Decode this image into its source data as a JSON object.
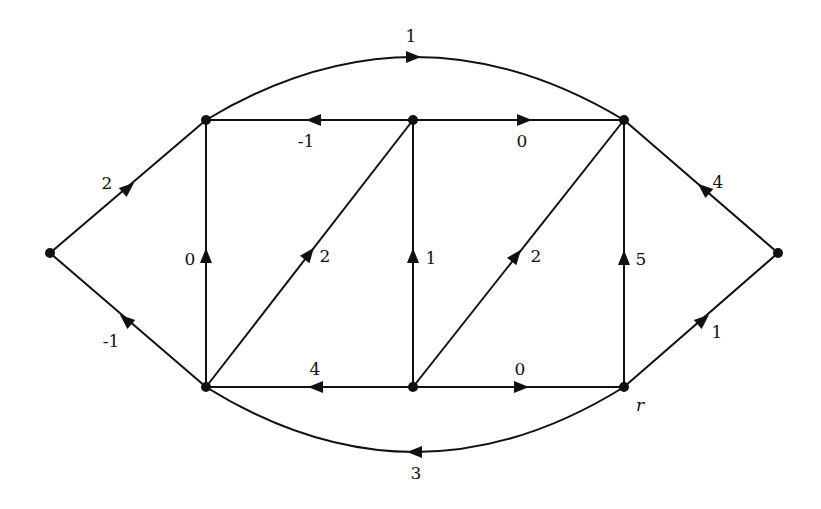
{
  "diagram": {
    "type": "directed-graph",
    "colors": {
      "stroke": "#111111",
      "background": "#ffffff"
    },
    "nodes": [
      {
        "id": "L",
        "x": 50,
        "y": 253,
        "label": ""
      },
      {
        "id": "TL",
        "x": 206,
        "y": 120,
        "label": ""
      },
      {
        "id": "TM",
        "x": 413,
        "y": 120,
        "label": ""
      },
      {
        "id": "TR",
        "x": 624,
        "y": 120,
        "label": ""
      },
      {
        "id": "R",
        "x": 778,
        "y": 253,
        "label": ""
      },
      {
        "id": "BL",
        "x": 206,
        "y": 387,
        "label": ""
      },
      {
        "id": "BM",
        "x": 413,
        "y": 387,
        "label": ""
      },
      {
        "id": "BR",
        "x": 624,
        "y": 387,
        "label": "r"
      }
    ],
    "edges": [
      {
        "from": "L",
        "to": "TL",
        "weight": "2",
        "lx": 107,
        "ly": 183
      },
      {
        "from": "BL",
        "to": "L",
        "weight": "-1",
        "lx": 111,
        "ly": 341
      },
      {
        "from": "TL",
        "to": "TR",
        "weight": "1",
        "curve": "top",
        "lx": 411,
        "ly": 36
      },
      {
        "from": "TM",
        "to": "TL",
        "weight": "-1",
        "lx": 306,
        "ly": 141
      },
      {
        "from": "TM",
        "to": "TR",
        "weight": "0",
        "lx": 522,
        "ly": 141
      },
      {
        "from": "BL",
        "to": "TL",
        "weight": "0",
        "lx": 190,
        "ly": 259
      },
      {
        "from": "BL",
        "to": "TM",
        "weight": "2",
        "lx": 325,
        "ly": 256
      },
      {
        "from": "BM",
        "to": "TM",
        "weight": "1",
        "lx": 431,
        "ly": 258
      },
      {
        "from": "BM",
        "to": "TR",
        "weight": "2",
        "lx": 536,
        "ly": 256
      },
      {
        "from": "BR",
        "to": "TR",
        "weight": "5",
        "lx": 641,
        "ly": 259
      },
      {
        "from": "R",
        "to": "TR",
        "weight": "4",
        "lx": 718,
        "ly": 182
      },
      {
        "from": "BR",
        "to": "R",
        "weight": "1",
        "lx": 717,
        "ly": 332
      },
      {
        "from": "BM",
        "to": "BL",
        "weight": "4",
        "lx": 315,
        "ly": 369
      },
      {
        "from": "BM",
        "to": "BR",
        "weight": "0",
        "lx": 520,
        "ly": 369
      },
      {
        "from": "BR",
        "to": "BL",
        "weight": "3",
        "curve": "bottom",
        "lx": 416,
        "ly": 473
      }
    ]
  }
}
